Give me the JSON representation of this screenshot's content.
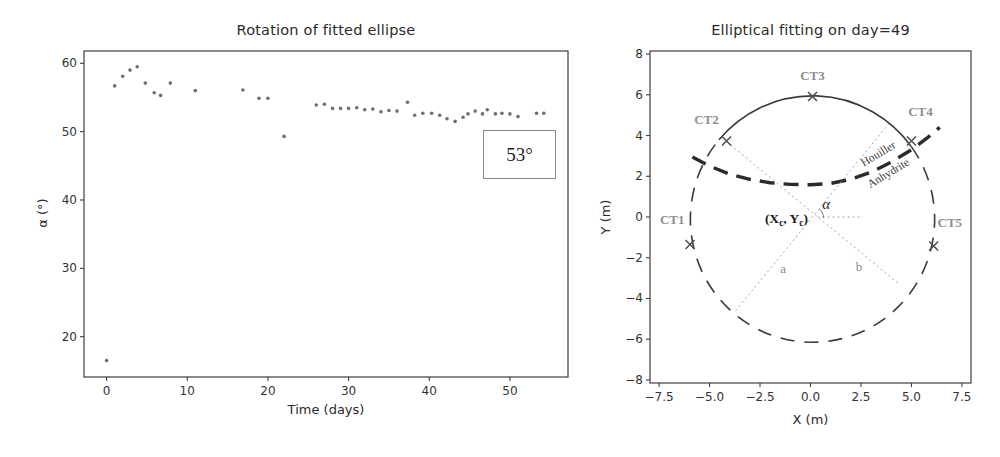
{
  "figure": {
    "background": "#ffffff",
    "width": 1000,
    "height": 457
  },
  "colors": {
    "frame": "#3f3f3f",
    "tick_text": "#333333",
    "title_text": "#2b2b2b",
    "scatter": "#6e6e6e",
    "annotation_border": "#8a8a8a",
    "annotation_text": "#1f1f1f",
    "circle": "#3a3a3a",
    "boundary": "#2b2b2b",
    "dotted": "#9a9a9a",
    "sensor_marker": "#4d4d4d",
    "sensor_label": "#8f8f8f",
    "geology_text": "#3f3f3f",
    "ab_label": "#8a8a8a",
    "center_label": "#1a1a1a",
    "alpha_label": "#222222"
  },
  "chart_data": [
    {
      "type": "scatter",
      "title": "Rotation of fitted ellipse",
      "xlabel": "Time (days)",
      "ylabel": "α (°)",
      "xlim": [
        -2.8,
        57.2
      ],
      "ylim": [
        14.1,
        61.8
      ],
      "frame_px": [
        84,
        51,
        484,
        326
      ],
      "grid": false,
      "xticks": {
        "values": [
          0,
          10,
          20,
          30,
          40,
          50
        ],
        "labels": [
          "0",
          "10",
          "20",
          "30",
          "40",
          "50"
        ]
      },
      "yticks": {
        "values": [
          20,
          30,
          40,
          50,
          60
        ],
        "labels": [
          "20",
          "30",
          "40",
          "50",
          "60"
        ]
      },
      "annotation": {
        "text": "53°",
        "box_px": [
          483,
          130,
          71,
          47
        ]
      },
      "points": [
        [
          0,
          16.5
        ],
        [
          1,
          56.7
        ],
        [
          2,
          58.1
        ],
        [
          2.9,
          59.0
        ],
        [
          3.8,
          59.5
        ],
        [
          4.8,
          57.1
        ],
        [
          5.9,
          55.7
        ],
        [
          6.7,
          55.3
        ],
        [
          7.9,
          57.1
        ],
        [
          11,
          56.0
        ],
        [
          16.9,
          56.1
        ],
        [
          18.9,
          54.9
        ],
        [
          20,
          54.9
        ],
        [
          22,
          49.3
        ],
        [
          26,
          53.9
        ],
        [
          27,
          54.0
        ],
        [
          28,
          53.4
        ],
        [
          29,
          53.4
        ],
        [
          30,
          53.4
        ],
        [
          31,
          53.5
        ],
        [
          32,
          53.2
        ],
        [
          33,
          53.3
        ],
        [
          34,
          52.9
        ],
        [
          35,
          53.1
        ],
        [
          36,
          53.0
        ],
        [
          37.3,
          54.3
        ],
        [
          38.2,
          52.4
        ],
        [
          39.2,
          52.7
        ],
        [
          40.3,
          52.7
        ],
        [
          41.3,
          52.4
        ],
        [
          42.2,
          51.9
        ],
        [
          43.2,
          51.5
        ],
        [
          44.2,
          52.1
        ],
        [
          44.8,
          52.6
        ],
        [
          45.7,
          53.0
        ],
        [
          46.6,
          52.6
        ],
        [
          47.2,
          53.2
        ],
        [
          48.2,
          52.6
        ],
        [
          49,
          52.7
        ],
        [
          50,
          52.6
        ],
        [
          51,
          52.2
        ],
        [
          53.3,
          52.7
        ],
        [
          54.2,
          52.7
        ]
      ]
    },
    {
      "type": "diagram",
      "title": "Elliptical fitting on day=49",
      "xlabel": "X (m)",
      "ylabel": "Y (m)",
      "xlim": [
        -7.95,
        7.95
      ],
      "ylim": [
        -8.15,
        8.15
      ],
      "frame_px": [
        650,
        51,
        321,
        332
      ],
      "grid": false,
      "xticks": {
        "values": [
          -7.5,
          -5,
          -2.5,
          0,
          2.5,
          5,
          7.5
        ],
        "labels": [
          "−7.5",
          "−5.0",
          "−2.5",
          "0.0",
          "2.5",
          "5.0",
          "7.5"
        ]
      },
      "yticks": {
        "values": [
          -8,
          -6,
          -4,
          -2,
          0,
          2,
          4,
          6,
          8
        ],
        "labels": [
          "−8",
          "−6",
          "−4",
          "−2",
          "0",
          "2",
          "4",
          "6",
          "8"
        ]
      },
      "circle": {
        "cx": 0.1,
        "cy": -0.1,
        "r": 6.05,
        "solid_arc_deg": [
          36,
          140
        ]
      },
      "boundary": {
        "points": [
          [
            -5.85,
            2.95
          ],
          [
            -5.0,
            2.5
          ],
          [
            -4.0,
            2.1
          ],
          [
            -3.0,
            1.85
          ],
          [
            -2.0,
            1.68
          ],
          [
            -1.0,
            1.6
          ],
          [
            0,
            1.58
          ],
          [
            1.0,
            1.65
          ],
          [
            2.0,
            1.85
          ],
          [
            3.0,
            2.2
          ],
          [
            4.0,
            2.7
          ],
          [
            5.0,
            3.3
          ],
          [
            5.8,
            3.9
          ],
          [
            6.4,
            4.4
          ]
        ],
        "labels": [
          {
            "text": "Houiller",
            "pos": [
              3.45,
              2.95
            ],
            "angle": -31
          },
          {
            "text": "Anhydrite",
            "pos": [
              3.95,
              2.0
            ],
            "angle": -31
          }
        ]
      },
      "dotted_lines": [
        {
          "name": "major-axis-a",
          "from": [
            -3.7,
            -4.6
          ],
          "to": [
            3.85,
            4.55
          ]
        },
        {
          "name": "minor-axis-b",
          "from": [
            -4.16,
            3.7
          ],
          "to": [
            4.4,
            -3.3
          ]
        },
        {
          "name": "alpha-baseline",
          "from": [
            0.35,
            0
          ],
          "to": [
            2.6,
            0
          ]
        }
      ],
      "angle_arc": {
        "vertex": [
          0.1,
          -0.05
        ],
        "radius": 0.55,
        "from_deg": 0,
        "to_deg": 53
      },
      "axis_letter_labels": [
        {
          "text": "a",
          "pos": [
            -1.35,
            -2.75
          ]
        },
        {
          "text": "b",
          "pos": [
            2.4,
            -2.65
          ]
        }
      ],
      "alpha_label": {
        "text": "α",
        "pos": [
          0.78,
          0.38
        ]
      },
      "center_label": {
        "text": "(Xc, Yc)",
        "anchor_pos": [
          -0.12,
          -0.3
        ],
        "parts": [
          {
            "t": "(X"
          },
          {
            "t": "c",
            "sub": true
          },
          {
            "t": ", Y"
          },
          {
            "t": "c",
            "sub": true
          },
          {
            "t": ")"
          }
        ]
      },
      "sensors": [
        {
          "name": "CT1",
          "marker": [
            -5.97,
            -1.35
          ],
          "label_pos": [
            -6.85,
            -0.35
          ]
        },
        {
          "name": "CT2",
          "marker": [
            -4.16,
            3.73
          ],
          "label_pos": [
            -5.15,
            4.55
          ]
        },
        {
          "name": "CT3",
          "marker": [
            0.1,
            5.92
          ],
          "label_pos": [
            0.1,
            6.75
          ]
        },
        {
          "name": "CT4",
          "marker": [
            5.0,
            3.73
          ],
          "label_pos": [
            5.45,
            4.95
          ]
        },
        {
          "name": "CT5",
          "marker": [
            6.1,
            -1.42
          ],
          "label_pos": [
            6.9,
            -0.5
          ]
        }
      ]
    }
  ]
}
